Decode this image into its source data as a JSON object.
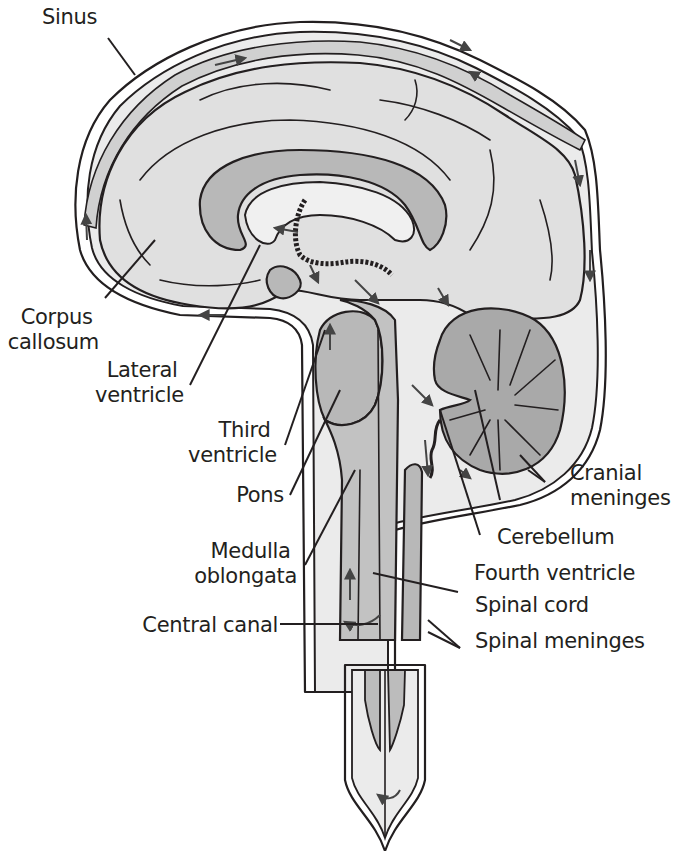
{
  "colors": {
    "background": "#ffffff",
    "line": "#231f20",
    "csf_space": "#ebebeb",
    "brain_tissue": "#e0e0e0",
    "ventricle_fill": "#b8b8b8",
    "cerebellum_fill": "#a9a9a9",
    "arrow": "#555555"
  },
  "labels": {
    "sinus": "Sinus",
    "corpus_callosum": [
      "Corpus",
      "callosum"
    ],
    "lateral_ventricle": [
      "Lateral",
      "ventricle"
    ],
    "third_ventricle": [
      "Third",
      "ventricle"
    ],
    "pons": "Pons",
    "medulla_oblongata": [
      "Medulla",
      "oblongata"
    ],
    "central_canal": "Central canal",
    "cranial_meninges": [
      "Cranial",
      "meninges"
    ],
    "cerebellum": "Cerebellum",
    "fourth_ventricle": "Fourth ventricle",
    "spinal_cord": "Spinal cord",
    "spinal_meninges": "Spinal meninges"
  }
}
